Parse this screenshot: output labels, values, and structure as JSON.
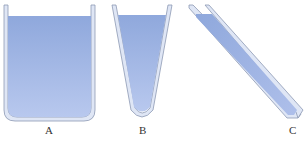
{
  "figure": {
    "containers": [
      {
        "id": "A",
        "label": "A",
        "shape": "wide-beaker"
      },
      {
        "id": "B",
        "label": "B",
        "shape": "tapered-cone"
      },
      {
        "id": "C",
        "label": "C",
        "shape": "slanted-tube"
      }
    ],
    "colors": {
      "liquid_top": "#8fa8dc",
      "liquid_bottom": "#b8c8ee",
      "glass_fill": "#dfe6f5",
      "glass_stroke": "#8d99b4",
      "label": "#333333"
    }
  }
}
